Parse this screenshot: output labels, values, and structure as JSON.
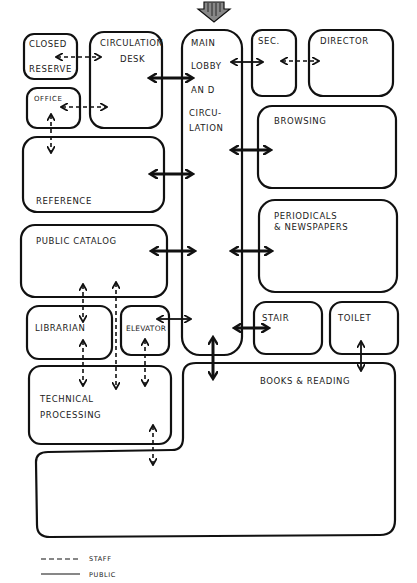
{
  "diagram": {
    "type": "library space adjacency diagram",
    "entrance": "entrance-arrow",
    "rooms": {
      "closed_reserve": [
        "CLOSED",
        "RESERVE"
      ],
      "circulation_desk": [
        "CIRCULATION",
        "DESK"
      ],
      "main_lobby": [
        "MAIN",
        "LOBBY",
        "AN D",
        "CIRCU-",
        "LATION"
      ],
      "sec": "SEC.",
      "director": "DIRECTOR",
      "office": "OFFICE",
      "browsing": "BROWSING",
      "reference": "REFERENCE",
      "periodicals": [
        "PERIODICALS",
        "& NEWSPAPERS"
      ],
      "public_catalog": "PUBLIC CATALOG",
      "librarian": "LIBRARIAN",
      "elevator": "ELEVATOR",
      "stair": "STAIR",
      "toilet": "TOILET",
      "technical_processing": [
        "TECHNICAL",
        "PROCESSING"
      ],
      "books_reading": "BOOKS & READING"
    },
    "legend": {
      "staff": "STAFF",
      "public": "PUBLIC"
    },
    "connections": [
      {
        "from": "Closed Reserve",
        "to": "Circulation Desk",
        "type": "staff"
      },
      {
        "from": "Office",
        "to": "Circulation Desk",
        "type": "staff"
      },
      {
        "from": "Circulation Desk",
        "to": "Main Lobby",
        "type": "public"
      },
      {
        "from": "Main Lobby",
        "to": "Sec.",
        "type": "public"
      },
      {
        "from": "Sec.",
        "to": "Director",
        "type": "staff"
      },
      {
        "from": "Office",
        "to": "Reference",
        "type": "staff"
      },
      {
        "from": "Main Lobby",
        "to": "Browsing",
        "type": "public"
      },
      {
        "from": "Reference",
        "to": "Main Lobby",
        "type": "public"
      },
      {
        "from": "Public Catalog",
        "to": "Main Lobby",
        "type": "public"
      },
      {
        "from": "Main Lobby",
        "to": "Periodicals & Newspapers",
        "type": "public"
      },
      {
        "from": "Public Catalog",
        "to": "Librarian",
        "type": "staff"
      },
      {
        "from": "Public Catalog",
        "to": "Technical Processing",
        "type": "staff"
      },
      {
        "from": "Librarian",
        "to": "Technical Processing",
        "type": "staff"
      },
      {
        "from": "Elevator",
        "to": "Main Lobby",
        "type": "public"
      },
      {
        "from": "Elevator",
        "to": "Technical Processing",
        "type": "staff"
      },
      {
        "from": "Main Lobby",
        "to": "Stair",
        "type": "public"
      },
      {
        "from": "Main Lobby",
        "to": "Books & Reading",
        "type": "public"
      },
      {
        "from": "Toilet",
        "to": "Books & Reading",
        "type": "public"
      },
      {
        "from": "Technical Processing",
        "to": "Books & Reading",
        "type": "staff"
      }
    ]
  }
}
